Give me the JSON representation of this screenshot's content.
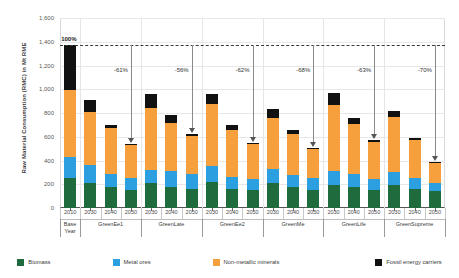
{
  "chart_data": {
    "type": "bar",
    "subtype": "stacked-bar",
    "title": "",
    "xlabel": "",
    "ylabel": "Raw Material Consumption (RMC) in Mt RME",
    "ylim": [
      0,
      1600
    ],
    "ytick_labels": [
      "0",
      "200",
      "400",
      "600",
      "800",
      "1,000",
      "1,200",
      "1,400",
      "1,600"
    ],
    "ytick_values": [
      0,
      200,
      400,
      600,
      800,
      1000,
      1200,
      1400,
      1600
    ],
    "grid": true,
    "legend_position": "bottom",
    "categories": [
      "2010",
      "2030",
      "2040",
      "2050",
      "2030",
      "2040",
      "2050",
      "2030",
      "2040",
      "2050",
      "2030",
      "2040",
      "2050",
      "2030",
      "2040",
      "2050",
      "2030",
      "2040",
      "2050"
    ],
    "groups": [
      {
        "name": "Base Year",
        "years": [
          "2010"
        ]
      },
      {
        "name": "GreenEe1",
        "years": [
          "2030",
          "2040",
          "2050"
        ]
      },
      {
        "name": "GreenLate",
        "years": [
          "2030",
          "2040",
          "2050"
        ]
      },
      {
        "name": "GreenEe2",
        "years": [
          "2030",
          "2040",
          "2050"
        ]
      },
      {
        "name": "GreenMe",
        "years": [
          "2030",
          "2040",
          "2050"
        ]
      },
      {
        "name": "GreenLife",
        "years": [
          "2030",
          "2040",
          "2050"
        ]
      },
      {
        "name": "GreenSupreme",
        "years": [
          "2030",
          "2040",
          "2050"
        ]
      }
    ],
    "series": [
      {
        "name": "Biomass",
        "color": "#1f6b3e",
        "values": [
          250,
          210,
          180,
          150,
          210,
          180,
          160,
          215,
          160,
          150,
          210,
          175,
          155,
          195,
          180,
          155,
          190,
          160,
          140
        ]
      },
      {
        "name": "Metal ores",
        "color": "#2b9fe0",
        "values": [
          180,
          150,
          110,
          105,
          110,
          130,
          125,
          140,
          105,
          95,
          120,
          105,
          95,
          120,
          105,
          90,
          110,
          95,
          70
        ]
      },
      {
        "name": "Non-metallic minerals",
        "color": "#f5a03c",
        "values": [
          560,
          450,
          380,
          275,
          520,
          405,
          320,
          525,
          390,
          290,
          430,
          340,
          245,
          550,
          420,
          310,
          465,
          315,
          170
        ]
      },
      {
        "name": "Fossil energy carriers",
        "color": "#111111",
        "values": [
          380,
          100,
          30,
          10,
          120,
          65,
          15,
          80,
          45,
          10,
          70,
          40,
          10,
          100,
          50,
          15,
          55,
          20,
          5
        ]
      }
    ],
    "totals": [
      1370,
      910,
      700,
      540,
      960,
      780,
      620,
      960,
      700,
      545,
      830,
      660,
      505,
      965,
      755,
      570,
      820,
      590,
      385
    ],
    "baseline_value": 1370,
    "baseline_label": "100%",
    "reduction_annotations": [
      {
        "group": "GreenEe1",
        "label": "-61%",
        "target_year": "2050",
        "target_value": 540
      },
      {
        "group": "GreenLate",
        "label": "-56%",
        "target_year": "2050",
        "target_value": 620
      },
      {
        "group": "GreenEe2",
        "label": "-62%",
        "target_year": "2050",
        "target_value": 545
      },
      {
        "group": "GreenMe",
        "label": "-68%",
        "target_year": "2050",
        "target_value": 505
      },
      {
        "group": "GreenLife",
        "label": "-63%",
        "target_year": "2050",
        "target_value": 570
      },
      {
        "group": "GreenSupreme",
        "label": "-70%",
        "target_year": "2050",
        "target_value": 385
      }
    ]
  },
  "legend": {
    "items": [
      {
        "label": "Biomass",
        "color": "#1f6b3e"
      },
      {
        "label": "Metal ores",
        "color": "#2b9fe0"
      },
      {
        "label": "Non-metallic minerals",
        "color": "#f5a03c"
      },
      {
        "label": "Fossil energy carriers",
        "color": "#111111"
      }
    ]
  }
}
